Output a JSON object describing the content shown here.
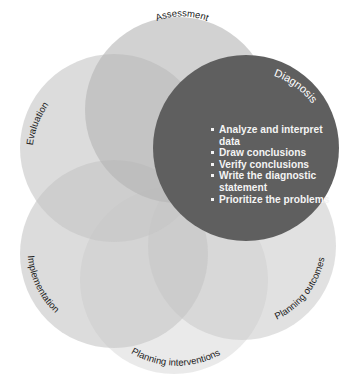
{
  "diagram": {
    "type": "overlapping-circles",
    "steps": [
      {
        "id": "assessment",
        "label": "Assessment",
        "highlighted": false
      },
      {
        "id": "diagnosis",
        "label": "Diagnosis",
        "highlighted": true
      },
      {
        "id": "planning-outcomes",
        "label": "Planning outcomes",
        "highlighted": false
      },
      {
        "id": "planning-interventions",
        "label": "Planning interventions",
        "highlighted": false
      },
      {
        "id": "implementation",
        "label": "Implementation",
        "highlighted": false
      },
      {
        "id": "evaluation",
        "label": "Evaluation",
        "highlighted": false
      }
    ],
    "diagnosis_bullets": [
      "Analyze and interpret data",
      "Draw conclusions",
      "Verify conclusions",
      "Write the diagnostic statement",
      "Prioritize the problems"
    ],
    "colors": {
      "highlight": "#5f5f5f",
      "circle_fill": "#b8b8b8",
      "text": "#222222",
      "highlight_text": "#ffffff"
    }
  }
}
